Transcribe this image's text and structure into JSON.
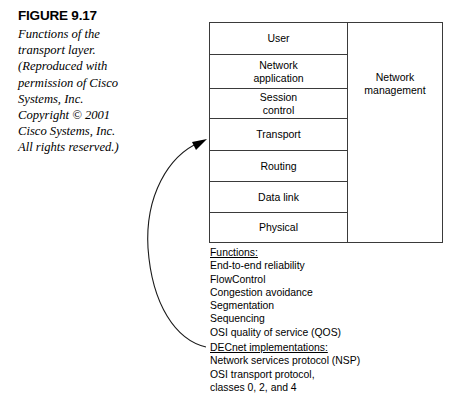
{
  "figure": {
    "number_label": "FIGURE 9.17",
    "caption_lines": [
      "Functions of the",
      "transport layer.",
      "(Reproduced with",
      "permission of Cisco",
      "Systems, Inc.",
      "Copyright © 2001",
      "Cisco Systems, Inc.",
      "All rights reserved.)"
    ]
  },
  "diagram": {
    "layers": [
      {
        "label": "User"
      },
      {
        "label": "Network\napplication"
      },
      {
        "label": "Session\ncontrol"
      },
      {
        "label": "Transport"
      },
      {
        "label": "Routing"
      },
      {
        "label": "Data link"
      },
      {
        "label": "Physical"
      }
    ],
    "side_column": {
      "label": "Network\nmanagement"
    }
  },
  "functions": {
    "heading": "Functions:",
    "items": [
      "End-to-end reliability",
      "FlowControl",
      "Congestion avoidance",
      "Segmentation",
      "Sequencing",
      "OSI quality of service (QOS)"
    ]
  },
  "decnet": {
    "heading": "DECnet implementations:",
    "items": [
      "Network services protocol (NSP)",
      "OSI transport protocol,",
      "classes 0, 2, and 4"
    ]
  },
  "colors": {
    "background": "#ffffff",
    "ink": "#000000",
    "rule": "#3a3a3a"
  }
}
